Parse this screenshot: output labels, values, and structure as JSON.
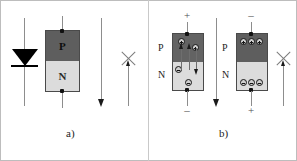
{
  "figure": {
    "width": 297,
    "height": 161,
    "background": "#ffffff"
  },
  "colors": {
    "p_region": "#5e5e5e",
    "n_region": "#dcdcdc",
    "block_border": "#4a4a4a",
    "wire": "#8d8d8d",
    "arrow": "#1a1a1a",
    "x_mark": "#7b7b7b",
    "text": "#232323"
  },
  "panels": [
    {
      "id": "a",
      "caption": "a)",
      "items": [
        {
          "name": "diode-symbol",
          "type": "schematic-diode"
        },
        {
          "name": "pn-block",
          "p_label": "P",
          "n_label": "N"
        },
        {
          "name": "current-arrow",
          "direction": "down"
        },
        {
          "name": "blocked-arrow",
          "direction": "up",
          "blocked": true,
          "mark": "x"
        }
      ]
    },
    {
      "id": "b",
      "caption": "b)",
      "items": [
        {
          "name": "forward-bias-block",
          "p_label": "P",
          "n_label": "N",
          "top_sign": "+",
          "bottom_sign": "–",
          "carriers": [
            {
              "glyph": "+",
              "region": "p"
            },
            {
              "glyph": "+",
              "region": "p"
            },
            {
              "glyph": "–",
              "region": "n"
            },
            {
              "glyph": "–",
              "region": "n"
            }
          ],
          "current_arrow": "down"
        },
        {
          "name": "forward-current-arrow",
          "direction": "down"
        },
        {
          "name": "reverse-bias-block",
          "p_label": "P",
          "n_label": "N",
          "top_sign": "–",
          "bottom_sign": "+",
          "carriers_p_row": [
            "+",
            "+",
            "+"
          ],
          "carriers_n_row": [
            "–",
            "–",
            "–"
          ],
          "current_arrow": "up"
        },
        {
          "name": "blocked-arrow",
          "direction": "up",
          "blocked": true,
          "mark": "x"
        }
      ]
    }
  ],
  "labels": {
    "P": "P",
    "N": "N",
    "plus": "+",
    "minus": "–",
    "caption_a": "a)",
    "caption_b": "b)"
  }
}
